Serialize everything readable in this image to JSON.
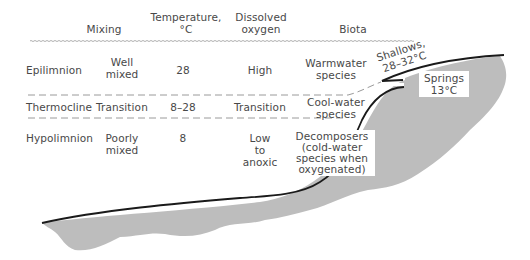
{
  "headers": {
    "mixing": "Mixing",
    "temperature_line1": "Temperature,",
    "temperature_line2": "°C",
    "oxygen_line1": "Dissolved",
    "oxygen_line2": "oxygen",
    "biota": "Biota"
  },
  "layers": [
    {
      "name": "Epilimnion",
      "mixing_line1": "Well",
      "mixing_line2": "mixed",
      "temperature": "28",
      "oxygen_line1": "High",
      "biota_line1": "Warmwater",
      "biota_line2": "species"
    },
    {
      "name": "Thermocline",
      "mixing_line1": "Transition",
      "temperature": "8–28",
      "oxygen_line1": "Transition",
      "biota_line1": "Cool-water",
      "biota_line2": "species"
    },
    {
      "name": "Hypolimnion",
      "mixing_line1": "Poorly",
      "mixing_line2": "mixed",
      "temperature": "8",
      "oxygen_line1": "Low",
      "oxygen_line2": "to",
      "oxygen_line3": "anoxic",
      "biota_line1": "Decomposers",
      "biota_line2": "(cold-water",
      "biota_line3": "species when",
      "biota_line4": "oxygenated)"
    }
  ],
  "annotations": {
    "shallows_line1": "Shallows,",
    "shallows_line2": "28–32°C",
    "springs_line1": "Springs",
    "springs_line2": "13°C"
  },
  "colors": {
    "basin_fill": "#bdbdbd",
    "shore_line": "#1a1a1a",
    "text": "#484848",
    "dashed_line": "#9a9a9a"
  }
}
